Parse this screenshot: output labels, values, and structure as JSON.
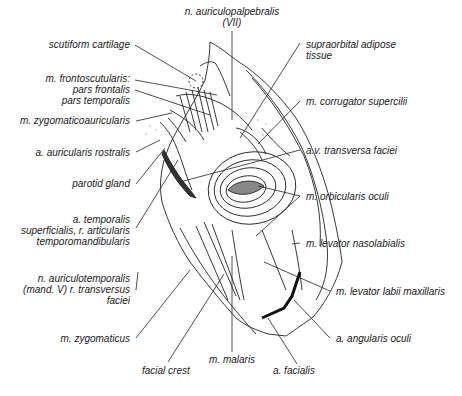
{
  "figure": {
    "type": "anatomical-illustration",
    "labels_left": [
      {
        "id": "scutiform",
        "text": "scutiform cartilage"
      },
      {
        "id": "frontoscutularis",
        "text": "m. frontoscutularis:\npars frontalis\npars temporalis"
      },
      {
        "id": "zygomaticoauricularis",
        "text": "m. zygomaticoauricularis"
      },
      {
        "id": "auricularis-rostralis",
        "text": "a. auricularis rostralis"
      },
      {
        "id": "parotid",
        "text": "parotid gland"
      },
      {
        "id": "temporalis-sup",
        "text": "a. temporalis\nsuperficialis, r. articularis\ntemporomandibularis"
      },
      {
        "id": "auriculotemporalis",
        "text": "n. auriculotemporalis\n(mand. V) r. transversus\nfaciei"
      },
      {
        "id": "zygomaticus",
        "text": "m. zygomaticus"
      }
    ],
    "labels_top": [
      {
        "id": "auriculopalpebralis",
        "text": "n. auriculopalpebralis\n(VII)"
      }
    ],
    "labels_right": [
      {
        "id": "supraorbital",
        "text": "supraorbital adipose\ntissue"
      },
      {
        "id": "corrugator",
        "text": "m. corrugator supercilii"
      },
      {
        "id": "transversa-faciei",
        "text": "a.v. transversa faciei"
      },
      {
        "id": "orbicularis",
        "text": "m. orbicularis oculi"
      },
      {
        "id": "levator-nasolabialis",
        "text": "m. levator nasolabialis"
      },
      {
        "id": "levator-labii",
        "text": "m. levator labii maxillaris"
      },
      {
        "id": "angularis",
        "text": "a. angularis oculi"
      }
    ],
    "labels_bottom": [
      {
        "id": "facial-crest",
        "text": "facial crest"
      },
      {
        "id": "malaris",
        "text": "m. malaris"
      },
      {
        "id": "facialis",
        "text": "a. facialis"
      }
    ]
  }
}
